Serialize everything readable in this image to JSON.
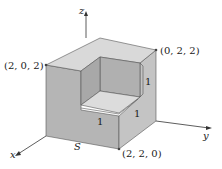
{
  "figure": {
    "axes": {
      "x_label": "x",
      "y_label": "y",
      "z_label": "z"
    },
    "points": [
      {
        "id": "p202",
        "label": "(2, 0, 2)"
      },
      {
        "id": "p022",
        "label": "(0, 2, 2)"
      },
      {
        "id": "p220",
        "label": "(2, 2, 0)"
      }
    ],
    "surface_label": "S",
    "notch_edge_labels": [
      "1",
      "1",
      "1"
    ],
    "colors": {
      "top_face": "#d9d9d9",
      "left_face": "#b5b5b5",
      "right_face": "#c4c4c4",
      "notch_back_wall": "#b0b0b0",
      "notch_side_wall": "#a8a8a8",
      "notch_floor": "#dcdcdc",
      "edge": "#555555",
      "axis": "#333333"
    }
  }
}
